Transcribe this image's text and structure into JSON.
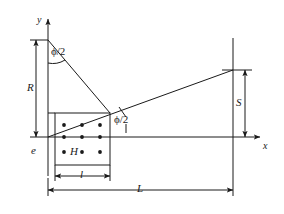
{
  "figure": {
    "type": "technical-line-diagram",
    "background_color": "#ffffff",
    "line_color": "#1a1a1a",
    "width": 284,
    "height": 214
  },
  "axes": {
    "y_label": "y",
    "x_label": "x",
    "origin_x": 48,
    "origin_y": 137
  },
  "labels": {
    "R": "R",
    "S": "S",
    "L": "L",
    "I": "l",
    "e": "e",
    "H": "H",
    "phi_top": "ϕ/2",
    "phi_mid": "ϕ/2"
  },
  "dimensions": [
    {
      "name": "R",
      "label": "R",
      "orientation": "vertical",
      "from": [
        48,
        40
      ],
      "to": [
        48,
        137
      ]
    },
    {
      "name": "S",
      "label": "S",
      "orientation": "vertical",
      "from": [
        233,
        70
      ],
      "to": [
        233,
        137
      ]
    },
    {
      "name": "L",
      "label": "L",
      "orientation": "horizontal",
      "from": [
        48,
        190
      ],
      "to": [
        233,
        190
      ]
    },
    {
      "name": "I",
      "label": "l",
      "orientation": "horizontal",
      "from": [
        55,
        176
      ],
      "to": [
        110,
        176
      ]
    }
  ],
  "angles": [
    {
      "name": "phi-over-2-top",
      "label": "ϕ/2",
      "vertex": [
        48,
        40
      ],
      "text_pos": [
        52,
        52
      ]
    },
    {
      "name": "phi-over-2-middle",
      "label": "ϕ/2",
      "vertex": [
        110,
        113
      ],
      "text_pos": [
        115,
        122
      ]
    }
  ],
  "region": {
    "name": "hatched-source-block",
    "rect": {
      "x": 55,
      "y": 113,
      "width": 55,
      "height": 52
    },
    "marker_label": "H",
    "dot_rows": 3,
    "dot_cols": 3,
    "dot_count": 9
  },
  "rays": [
    {
      "name": "upper-boundary-ray",
      "from": [
        48,
        40
      ],
      "to": [
        110,
        113
      ]
    },
    {
      "name": "lower-boundary-ray",
      "from": [
        48,
        137
      ],
      "to": [
        233,
        70
      ]
    }
  ]
}
